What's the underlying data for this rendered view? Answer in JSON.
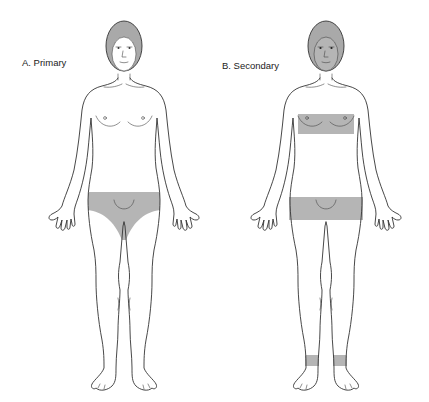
{
  "figures": [
    {
      "id": "A",
      "label": "A. Primary",
      "shaded_regions": [
        "pubic-area"
      ]
    },
    {
      "id": "B",
      "label": "B. Secondary",
      "shaded_regions": [
        "face",
        "chest-band",
        "lower-abdomen-upper-thigh-band",
        "ankle-bands"
      ]
    }
  ],
  "colors": {
    "shading": "#b5b5b5",
    "hair": "#a9a9a9",
    "outline": "#333333",
    "background": "#ffffff"
  }
}
